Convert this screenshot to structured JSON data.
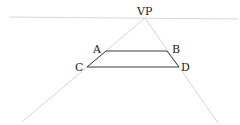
{
  "diagram": {
    "colors": {
      "construction": "#d6d6d6",
      "shape": "#3a3a3a",
      "label": "#222222"
    },
    "horizon": {
      "x1": 9,
      "y1": 17,
      "x2": 238,
      "y2": 19
    },
    "vanishing_point": {
      "label": "VP",
      "x": 145,
      "y": 18,
      "label_x": 137,
      "label_y": 15
    },
    "rays": [
      {
        "name": "ray-left",
        "x1": 145,
        "y1": 18,
        "x2": 22,
        "y2": 122
      },
      {
        "name": "ray-right",
        "x1": 145,
        "y1": 18,
        "x2": 218,
        "y2": 123
      }
    ],
    "points": [
      {
        "label": "A",
        "x": 106,
        "y": 51,
        "label_x": 93,
        "label_y": 53
      },
      {
        "label": "B",
        "x": 167,
        "y": 51,
        "label_x": 172,
        "label_y": 53
      },
      {
        "label": "C",
        "x": 87,
        "y": 67,
        "label_x": 75,
        "label_y": 71
      },
      {
        "label": "D",
        "x": 179,
        "y": 67,
        "label_x": 181,
        "label_y": 71
      }
    ]
  }
}
